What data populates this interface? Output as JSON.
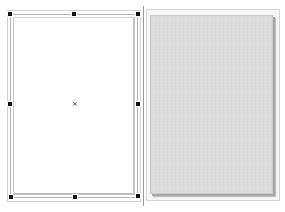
{
  "canvas": {
    "width": 285,
    "height": 212,
    "background": "#ffffff"
  },
  "left_panel": {
    "role": "editable page (selected)",
    "page_fill": "#ffffff",
    "border_color": "#b5b5b5",
    "selected": true,
    "center_marker": {
      "icon": "center-cross-icon",
      "glyph": "×"
    },
    "handles": [
      {
        "name": "handle-top-left",
        "x": 10,
        "y": 14
      },
      {
        "name": "handle-top-middle",
        "x": 74,
        "y": 14
      },
      {
        "name": "handle-top-right",
        "x": 138,
        "y": 14
      },
      {
        "name": "handle-middle-left",
        "x": 10,
        "y": 104
      },
      {
        "name": "handle-middle-right",
        "x": 138,
        "y": 104
      },
      {
        "name": "handle-bottom-left",
        "x": 11,
        "y": 197
      },
      {
        "name": "handle-bottom-middle",
        "x": 75,
        "y": 197
      },
      {
        "name": "handle-bottom-right",
        "x": 138,
        "y": 196
      }
    ],
    "handle_color": "#111111"
  },
  "divider": {
    "color": "#9a9a9a"
  },
  "right_panel": {
    "role": "page preview",
    "page_fill": "#dcdcdc",
    "shadow_color": "#a9a9a9"
  }
}
